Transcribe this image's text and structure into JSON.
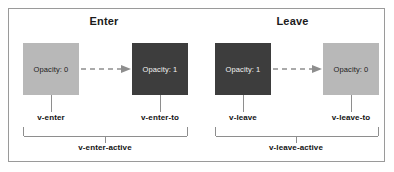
{
  "diagram": {
    "colors": {
      "box_light": "#b8b8b8",
      "box_dark": "#3d3d3d",
      "frame_border": "#9a9a9a",
      "connector": "#8e8e8e",
      "text_dark": "#121212",
      "text_light": "#f2f2f2"
    },
    "sections": [
      {
        "key": "enter",
        "title": "Enter",
        "from_box": {
          "label": "Opacity: 0",
          "shade": "light",
          "tick_label": "v-enter"
        },
        "to_box": {
          "label": "Opacity: 1",
          "shade": "dark",
          "tick_label": "v-enter-to"
        },
        "arrow_icon": "dashed-arrow-right-icon",
        "bracket_label": "v-enter-active"
      },
      {
        "key": "leave",
        "title": "Leave",
        "from_box": {
          "label": "Opacity: 1",
          "shade": "dark",
          "tick_label": "v-leave"
        },
        "to_box": {
          "label": "Opacity: 0",
          "shade": "light",
          "tick_label": "v-leave-to"
        },
        "arrow_icon": "dashed-arrow-right-icon",
        "bracket_label": "v-leave-active"
      }
    ]
  }
}
